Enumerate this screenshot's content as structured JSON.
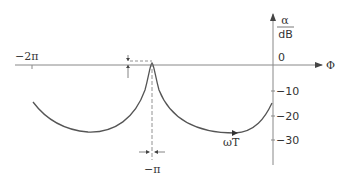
{
  "diagram": {
    "y_axis_label_numerator": "α",
    "y_axis_label_denominator": "dB",
    "x_axis_label": "Φ",
    "curve_label": "ωT",
    "x_ticks": [
      {
        "label": "−2π",
        "value": "-2pi"
      },
      {
        "label": "−π",
        "value": "-pi"
      }
    ],
    "y_ticks": [
      {
        "label": "0",
        "value": 0
      },
      {
        "label": "−10",
        "value": -10
      },
      {
        "label": "−20",
        "value": -20
      },
      {
        "label": "−30",
        "value": -30
      }
    ],
    "colors": {
      "line": "#555555",
      "text": "#333333",
      "axis": "#777777"
    }
  }
}
